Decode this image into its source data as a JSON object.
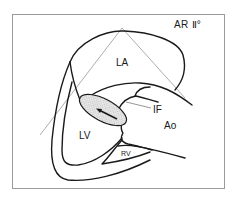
{
  "figure": {
    "title": "AR Ⅱ°",
    "labels": {
      "la": "LA",
      "lv": "LV",
      "ao": "Ao",
      "rv": "RV",
      "if": "IF"
    },
    "colors": {
      "stroke": "#1a1a1a",
      "guide_line": "#8a8a8a",
      "frame": "#9a9a9a",
      "jet_fill": "#e6e6e6",
      "background": "#ffffff"
    }
  }
}
